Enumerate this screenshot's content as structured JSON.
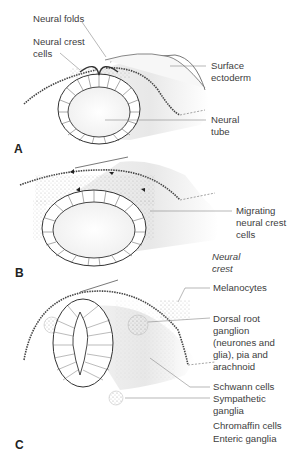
{
  "figure": {
    "panels": [
      {
        "id": "A",
        "label": "A",
        "annotations": [
          {
            "key": "neural_folds",
            "text": "Neural folds"
          },
          {
            "key": "neural_crest_cells",
            "text": "Neural crest\ncells"
          },
          {
            "key": "surface_ectoderm",
            "text": "Surface\nectoderm"
          },
          {
            "key": "neural_tube",
            "text": "Neural\ntube"
          }
        ]
      },
      {
        "id": "B",
        "label": "B",
        "annotations": [
          {
            "key": "migrating_ncc",
            "text": "Migrating\nneural crest\ncells"
          },
          {
            "key": "neural_crest_heading",
            "text": "Neural\ncrest"
          }
        ]
      },
      {
        "id": "C",
        "label": "C",
        "annotations": [
          {
            "key": "melanocytes",
            "text": "Melanocytes"
          },
          {
            "key": "drg",
            "text": "Dorsal root\nganglion\n(neurones and\nglia), pia and\narachnoid"
          },
          {
            "key": "schwann",
            "text": "Schwann cells"
          },
          {
            "key": "sympathetic",
            "text": "Sympathetic\nganglia"
          },
          {
            "key": "chromaffin",
            "text": "Chromaffin cells"
          },
          {
            "key": "enteric",
            "text": "Enteric ganglia"
          }
        ]
      }
    ],
    "colors": {
      "line": "#333333",
      "leader": "#888888",
      "shade": "#e6e6e6",
      "cell_dots": "#9a9a9a"
    }
  }
}
